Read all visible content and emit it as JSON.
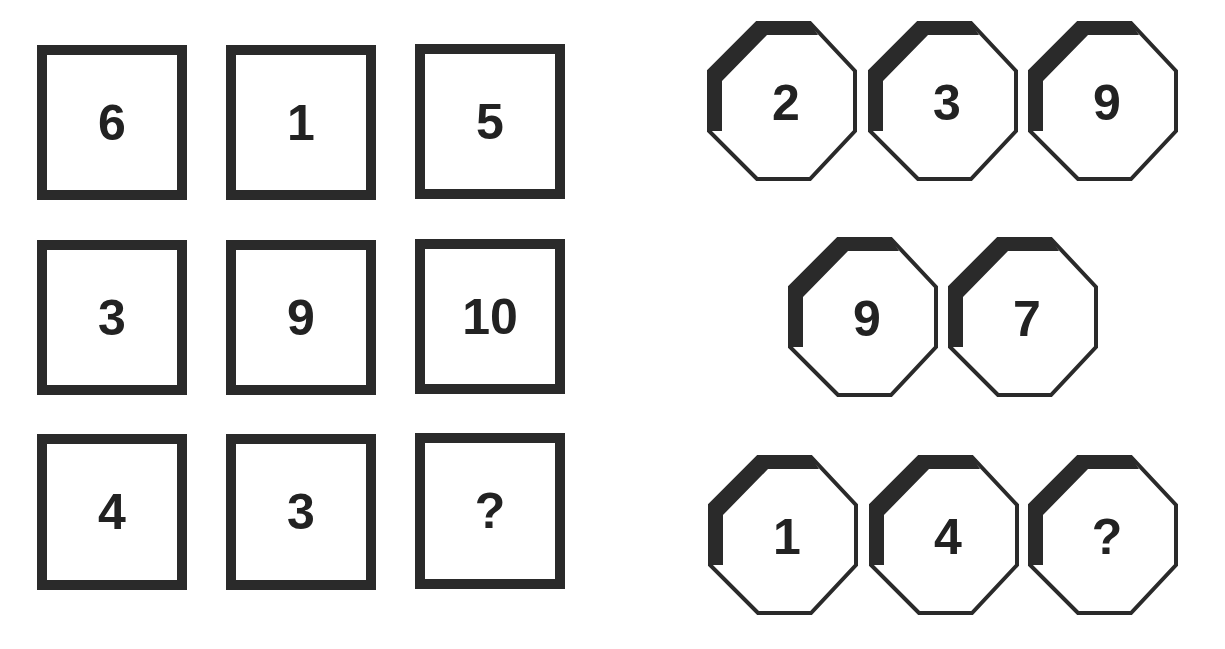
{
  "puzzle_squares": {
    "rows": [
      [
        "6",
        "1",
        "5"
      ],
      [
        "3",
        "9",
        "10"
      ],
      [
        "4",
        "3",
        "?"
      ]
    ]
  },
  "puzzle_octagons": {
    "rows": [
      [
        "2",
        "3",
        "9"
      ],
      [
        "9",
        "7"
      ],
      [
        "1",
        "4",
        "?"
      ]
    ]
  },
  "colors": {
    "border": "#2a2a2a",
    "text": "#222222",
    "background": "#ffffff"
  }
}
